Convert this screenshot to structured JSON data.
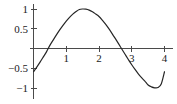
{
  "figure": {
    "background_color": "#ffffff",
    "axis_color": "#4a4a4a",
    "curve_color": "#262626",
    "text_color": "#1a1a1a"
  },
  "chart_data": {
    "type": "line",
    "title": "",
    "subtitle": "",
    "xlabel": "",
    "ylabel": "",
    "xlim": [
      -0.15,
      4.15
    ],
    "ylim": [
      -1.2,
      1.2
    ],
    "grid": false,
    "legend": null,
    "legend_position": "none",
    "annotations": [],
    "x_ticks": [
      1,
      2,
      3,
      4
    ],
    "x_tick_labels": [
      "1",
      "2",
      "3",
      "4"
    ],
    "y_ticks": [
      1,
      0.5,
      -0.5,
      -1
    ],
    "y_tick_labels": [
      "1",
      "0.5",
      "−0.5",
      "−1"
    ],
    "series": [
      {
        "name": "sine",
        "color": "#262626",
        "x": [
          0.0,
          0.1,
          0.2,
          0.3,
          0.4,
          0.5,
          0.6,
          0.7,
          0.8,
          0.9,
          1.0,
          1.1,
          1.2,
          1.3,
          1.4,
          1.5,
          1.6,
          1.7,
          1.8,
          1.9,
          2.0,
          2.1,
          2.2,
          2.3,
          2.4,
          2.5,
          2.6,
          2.7,
          2.8,
          2.9,
          3.0,
          3.1,
          3.2,
          3.3,
          3.4,
          3.5,
          3.6,
          3.7,
          3.8,
          3.9,
          4.0
        ],
        "y": [
          -0.588,
          -0.471,
          -0.345,
          -0.213,
          -0.078,
          0.078,
          0.213,
          0.345,
          0.471,
          0.588,
          0.695,
          0.79,
          0.871,
          0.937,
          0.988,
          1.0,
          0.995,
          0.972,
          0.93,
          0.872,
          0.809,
          0.719,
          0.616,
          0.501,
          0.378,
          0.249,
          0.116,
          -0.019,
          -0.153,
          -0.285,
          -0.412,
          -0.531,
          -0.641,
          -0.739,
          -0.825,
          -0.924,
          -0.971,
          -0.995,
          -0.988,
          -0.9,
          -0.588
        ]
      }
    ]
  },
  "axes": {
    "x_axis_name": "horizontal-axis",
    "y_axis_name": "vertical-axis"
  }
}
